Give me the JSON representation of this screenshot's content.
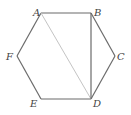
{
  "diagram": {
    "type": "regular-hexagon",
    "colors": {
      "edge": "#6b6b6b",
      "diagonal_ad": "#c4c4c4",
      "diagonal_bd": "#6b6b6b",
      "label": "#444444"
    },
    "vertices": [
      {
        "id": "A",
        "label": "A",
        "x": 41,
        "y": 13,
        "lx": 33,
        "ly": 16
      },
      {
        "id": "B",
        "label": "B",
        "x": 91,
        "y": 13,
        "lx": 94,
        "ly": 16
      },
      {
        "id": "C",
        "label": "C",
        "x": 115,
        "y": 56,
        "lx": 117,
        "ly": 60
      },
      {
        "id": "D",
        "label": "D",
        "x": 91,
        "y": 99,
        "lx": 93,
        "ly": 107
      },
      {
        "id": "E",
        "label": "E",
        "x": 41,
        "y": 99,
        "lx": 30,
        "ly": 107
      },
      {
        "id": "F",
        "label": "F",
        "x": 17,
        "y": 56,
        "lx": 6,
        "ly": 60
      }
    ],
    "edges": [
      [
        "A",
        "B"
      ],
      [
        "B",
        "C"
      ],
      [
        "C",
        "D"
      ],
      [
        "D",
        "E"
      ],
      [
        "E",
        "F"
      ],
      [
        "F",
        "A"
      ]
    ],
    "diagonals": [
      {
        "from": "A",
        "to": "D",
        "style": "light"
      },
      {
        "from": "B",
        "to": "D",
        "style": "dark"
      }
    ]
  }
}
